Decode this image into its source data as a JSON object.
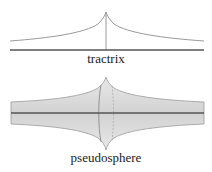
{
  "figures": [
    {
      "id": "tractrix",
      "label": "tractrix"
    },
    {
      "id": "pseudosphere",
      "label": "pseudosphere"
    }
  ],
  "colors": {
    "curve": "#9a9a9a",
    "axis": "#555555",
    "surface_fill": "#dedede",
    "background": "#ffffff"
  }
}
